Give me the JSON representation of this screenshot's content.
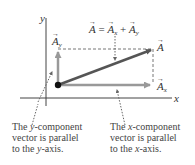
{
  "diagram": {
    "axes": {
      "x_label": "x",
      "y_label": "y"
    },
    "vectors": {
      "a": {
        "name": "A",
        "color": "#555555"
      },
      "ax": {
        "name": "A",
        "sub": "x",
        "color": "#999999"
      },
      "ay": {
        "name": "A",
        "sub": "y",
        "color": "#999999"
      }
    },
    "equation": {
      "lhs": "A",
      "eq": " = ",
      "t1": "A",
      "t1_sub": "x",
      "plus": " + ",
      "t2": "A",
      "t2_sub": "y"
    },
    "captions": {
      "left": {
        "l1a": "The ",
        "l1b": "y",
        "l1c": "-component",
        "l2": "vector is parallel",
        "l3a": "to the ",
        "l3b": "y",
        "l3c": "-axis."
      },
      "right": {
        "l1a": "The ",
        "l1b": "x",
        "l1c": "-component",
        "l2": "vector is parallel",
        "l3a": "to the ",
        "l3b": "x",
        "l3c": "-axis."
      }
    }
  }
}
